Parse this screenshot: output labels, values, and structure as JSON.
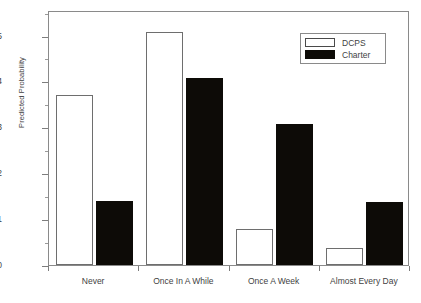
{
  "chart_data": {
    "type": "bar",
    "title": "",
    "subtitle": "",
    "xlabel": "",
    "ylabel": "Predicted Probability",
    "categories": [
      "Never",
      "Once In A While",
      "Once A Week",
      "Almost Every Day"
    ],
    "series": [
      {
        "name": "DCPS",
        "color": "#ffffff",
        "values": [
          0.37,
          0.507,
          0.079,
          0.038
        ]
      },
      {
        "name": "Charter",
        "color": "#000000",
        "values": [
          0.14,
          0.407,
          0.307,
          0.137
        ]
      }
    ],
    "ylim": [
      0.0,
      0.5556
    ],
    "ytick_labels": [
      "0.0",
      "0.1",
      "0.2",
      "0.3",
      "0.4",
      "0.5"
    ],
    "ytick_values": [
      0.0,
      0.1,
      0.2,
      0.3,
      0.4,
      0.5
    ],
    "yminor_values": [
      0.05,
      0.15,
      0.25,
      0.35,
      0.45,
      0.55
    ],
    "grid": false,
    "legend_position": "top-right",
    "legend_entries": [
      "DCPS",
      "Charter"
    ]
  },
  "axes": {
    "y_title": "Predicted Probability",
    "y_ticks": [
      {
        "label": "0.5",
        "value": 0.5
      },
      {
        "label": "0.4",
        "value": 0.4
      },
      {
        "label": "0.3",
        "value": 0.3
      },
      {
        "label": "0.2",
        "value": 0.2
      },
      {
        "label": "0.1",
        "value": 0.1
      },
      {
        "label": "0.0",
        "value": 0.0
      }
    ],
    "x_categories": [
      {
        "label": "Never"
      },
      {
        "label": "Once In A While"
      },
      {
        "label": "Once A Week"
      },
      {
        "label": "Almost Every Day"
      }
    ]
  },
  "legend": {
    "items": [
      {
        "label": "DCPS"
      },
      {
        "label": "Charter"
      }
    ]
  }
}
